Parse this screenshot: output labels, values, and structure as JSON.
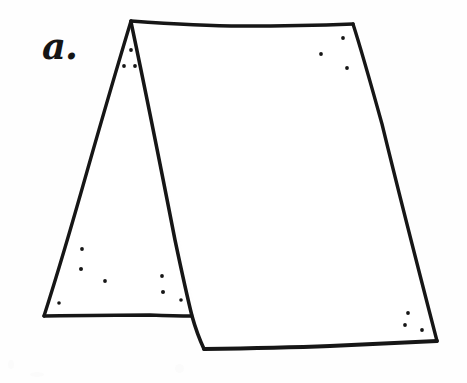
{
  "figure": {
    "label": "a.",
    "caption_text": "a.",
    "medium": "hand-drawn ink line illustration",
    "stroke_color": "#161616",
    "fill_color": "#ffffff",
    "background_color": "#fefefe",
    "stroke_width": 3.2,
    "canvas": {
      "width": 467,
      "height": 383
    }
  },
  "geometry": {
    "points": {
      "apex": {
        "x": 131,
        "y": 21
      },
      "top_right": {
        "x": 353,
        "y": 24
      },
      "bottom_right": {
        "x": 437,
        "y": 341
      },
      "front_bottom_left": {
        "x": 204,
        "y": 349
      },
      "ridge_base": {
        "x": 192,
        "y": 316
      },
      "triangle_bottom_left": {
        "x": 44,
        "y": 316
      }
    },
    "side_panel_path": "M 131 21 L 44 316 L 192 316 Z",
    "front_panel_path": "M 131 21 L 353 24 L 437 341 L 204 349 Z",
    "ridge_line_path": "M 131 22 L 192 316 L 204 349",
    "top_edge_path": "M 131 21 L 240 26 L 353 24",
    "right_edge_path": "M 353 24 L 400 190 L 437 341",
    "bottom_edge_path": "M 204 349 L 320 346 L 437 341",
    "left_slope_path": "M 131 21 L 88 168 L 44 316",
    "triangle_base_path": "M 44 316 L 120 315 L 192 316"
  },
  "stipple_dots": [
    {
      "name": "dot-apex-1",
      "x": 131,
      "y": 50,
      "r": 1.9
    },
    {
      "name": "dot-apex-2",
      "x": 124,
      "y": 66,
      "r": 1.9
    },
    {
      "name": "dot-apex-3",
      "x": 135,
      "y": 66,
      "r": 1.9
    },
    {
      "name": "dot-lowleft-1",
      "x": 82,
      "y": 249,
      "r": 1.9
    },
    {
      "name": "dot-lowleft-2",
      "x": 81,
      "y": 269,
      "r": 2.0
    },
    {
      "name": "dot-lowleft-3",
      "x": 105,
      "y": 281,
      "r": 1.9
    },
    {
      "name": "dot-lowleft-4",
      "x": 59,
      "y": 303,
      "r": 1.8
    },
    {
      "name": "dot-lowmid-1",
      "x": 162,
      "y": 276,
      "r": 1.9
    },
    {
      "name": "dot-lowmid-2",
      "x": 163,
      "y": 292,
      "r": 2.0
    },
    {
      "name": "dot-lowmid-3",
      "x": 181,
      "y": 300,
      "r": 1.8
    },
    {
      "name": "dot-topright-1",
      "x": 343,
      "y": 38,
      "r": 1.9
    },
    {
      "name": "dot-topright-2",
      "x": 321,
      "y": 54,
      "r": 1.9
    },
    {
      "name": "dot-topright-3",
      "x": 347,
      "y": 68,
      "r": 1.9
    },
    {
      "name": "dot-botright-1",
      "x": 408,
      "y": 313,
      "r": 1.9
    },
    {
      "name": "dot-botright-2",
      "x": 405,
      "y": 325,
      "r": 1.9
    },
    {
      "name": "dot-botright-3",
      "x": 422,
      "y": 330,
      "r": 1.9
    }
  ]
}
